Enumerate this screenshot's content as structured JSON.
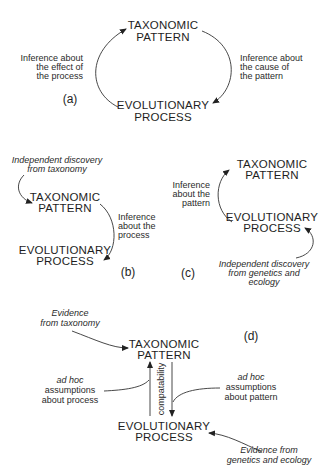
{
  "nodes": {
    "taxonomic_pattern": [
      "TAXONOMIC",
      "PATTERN"
    ],
    "evolutionary_process": [
      "EVOLUTIONARY",
      "PROCESS"
    ]
  },
  "panel_a": {
    "label": "(a)",
    "left_label": [
      "Inference about",
      "the effect of",
      "the process"
    ],
    "right_label": [
      "Inference about",
      "the cause of",
      "the pattern"
    ]
  },
  "panel_b": {
    "label": "(b)",
    "top_label": [
      "Independent discovery",
      "from taxonomy"
    ],
    "right_label": [
      "Inference",
      "about the",
      "process"
    ]
  },
  "panel_c": {
    "label": "(c)",
    "left_label": [
      "Inference",
      "about the",
      "pattern"
    ],
    "bottom_label": [
      "Independent discovery",
      "from genetics and",
      "ecology"
    ]
  },
  "panel_d": {
    "label": "(d)",
    "top_left_label": [
      "Evidence",
      "from taxonomy"
    ],
    "left_label": [
      "ad hoc",
      "assumptions",
      "about process"
    ],
    "right_label": [
      "ad hoc",
      "assumptions",
      "about pattern"
    ],
    "middle_label": "compatability",
    "bottom_right_label": [
      "Evidence from",
      "genetics and ecology"
    ]
  }
}
